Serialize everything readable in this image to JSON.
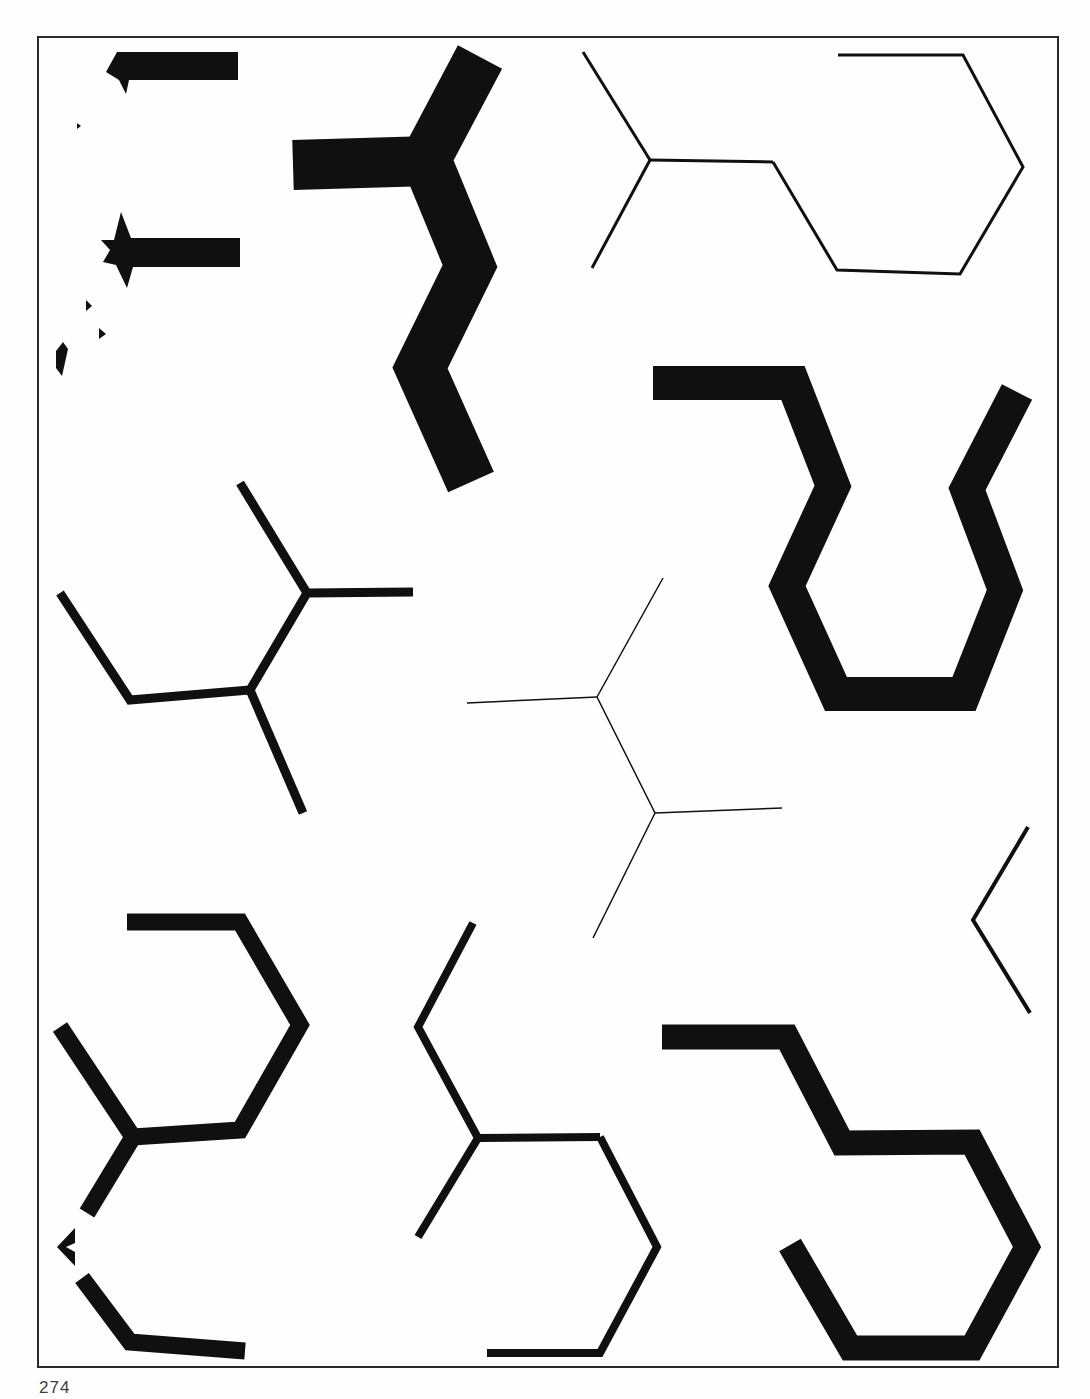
{
  "page": {
    "number": "274"
  },
  "canvas": {
    "width": 1090,
    "height": 1399,
    "paper_color": "#fefefe",
    "ink_color": "#101010",
    "frame": {
      "x": 38,
      "y": 37,
      "width": 1020,
      "height": 1330,
      "stroke": "#2a2a2a",
      "stroke_width": 2
    }
  },
  "figures": [
    {
      "name": "topleft-bar-fragment",
      "kind": "polygon",
      "points": [
        [
          117,
          52
        ],
        [
          238,
          52
        ],
        [
          238,
          80
        ],
        [
          129,
          80
        ],
        [
          126,
          94
        ],
        [
          119,
          80
        ],
        [
          106,
          72
        ]
      ]
    },
    {
      "name": "topleft-star-bar",
      "kind": "polygon",
      "points": [
        [
          121,
          212
        ],
        [
          131,
          238
        ],
        [
          240,
          238
        ],
        [
          240,
          267
        ],
        [
          133,
          267
        ],
        [
          127,
          288
        ],
        [
          116,
          265
        ],
        [
          103,
          262
        ],
        [
          110,
          250
        ],
        [
          101,
          240
        ],
        [
          114,
          240
        ]
      ]
    },
    {
      "name": "topleft-speck-1",
      "kind": "polygon",
      "points": [
        [
          77,
          123
        ],
        [
          81,
          126
        ],
        [
          77,
          129
        ]
      ]
    },
    {
      "name": "topleft-speck-2",
      "kind": "polygon",
      "points": [
        [
          86,
          300
        ],
        [
          92,
          306
        ],
        [
          86,
          311
        ]
      ]
    },
    {
      "name": "topleft-speck-3",
      "kind": "polygon",
      "points": [
        [
          99,
          328
        ],
        [
          106,
          334
        ],
        [
          99,
          339
        ]
      ]
    },
    {
      "name": "topleft-blob",
      "kind": "polygon",
      "points": [
        [
          63,
          342
        ],
        [
          68,
          349
        ],
        [
          62,
          376
        ],
        [
          56,
          368
        ],
        [
          56,
          351
        ]
      ]
    },
    {
      "name": "topmid-zigzag-spine",
      "kind": "polyline",
      "w": 50,
      "points": [
        [
          480,
          57
        ],
        [
          426,
          159
        ],
        [
          470,
          266
        ],
        [
          420,
          368
        ],
        [
          471,
          482
        ]
      ]
    },
    {
      "name": "topmid-zigzag-arm",
      "kind": "polyline",
      "w": 50,
      "points": [
        [
          293,
          165
        ],
        [
          430,
          161
        ]
      ]
    },
    {
      "name": "topright-y-upper",
      "kind": "polyline",
      "w": 3,
      "points": [
        [
          583,
          52
        ],
        [
          650,
          160
        ]
      ]
    },
    {
      "name": "topright-y-arm",
      "kind": "polyline",
      "w": 3,
      "points": [
        [
          650,
          160
        ],
        [
          773,
          162
        ]
      ]
    },
    {
      "name": "topright-y-lower",
      "kind": "polyline",
      "w": 3,
      "points": [
        [
          650,
          160
        ],
        [
          592,
          268
        ]
      ]
    },
    {
      "name": "topright-hexagon",
      "kind": "polyline",
      "w": 3,
      "points": [
        [
          773,
          162
        ],
        [
          837,
          270
        ],
        [
          960,
          274
        ],
        [
          1023,
          167
        ],
        [
          963,
          55
        ],
        [
          838,
          55
        ]
      ]
    },
    {
      "name": "midright-cup",
      "kind": "polyline",
      "w": 34,
      "points": [
        [
          653,
          383
        ],
        [
          793,
          383
        ],
        [
          833,
          486
        ],
        [
          787,
          586
        ],
        [
          836,
          694
        ],
        [
          964,
          694
        ],
        [
          1005,
          590
        ],
        [
          967,
          489
        ],
        [
          1017,
          392
        ]
      ]
    },
    {
      "name": "midleft-y-upper",
      "kind": "polyline",
      "w": 9,
      "points": [
        [
          240,
          483
        ],
        [
          307,
          593
        ]
      ]
    },
    {
      "name": "midleft-y-arm",
      "kind": "polyline",
      "w": 9,
      "points": [
        [
          307,
          593
        ],
        [
          413,
          592
        ]
      ]
    },
    {
      "name": "midleft-chain",
      "kind": "polyline",
      "w": 9,
      "points": [
        [
          307,
          593
        ],
        [
          250,
          690
        ],
        [
          130,
          700
        ],
        [
          60,
          593
        ]
      ]
    },
    {
      "name": "midleft-branch",
      "kind": "polyline",
      "w": 9,
      "points": [
        [
          250,
          690
        ],
        [
          303,
          813
        ]
      ]
    },
    {
      "name": "center-thin-upper",
      "kind": "polyline",
      "w": 1.5,
      "points": [
        [
          663,
          578
        ],
        [
          597,
          697
        ]
      ]
    },
    {
      "name": "center-thin-left-arm",
      "kind": "polyline",
      "w": 1.5,
      "points": [
        [
          597,
          697
        ],
        [
          467,
          703
        ]
      ]
    },
    {
      "name": "center-thin-mid",
      "kind": "polyline",
      "w": 1.5,
      "points": [
        [
          597,
          697
        ],
        [
          655,
          813
        ]
      ]
    },
    {
      "name": "center-thin-right-arm",
      "kind": "polyline",
      "w": 1.5,
      "points": [
        [
          655,
          813
        ],
        [
          782,
          808
        ]
      ]
    },
    {
      "name": "center-thin-lower",
      "kind": "polyline",
      "w": 1.5,
      "points": [
        [
          655,
          813
        ],
        [
          593,
          938
        ]
      ]
    },
    {
      "name": "bottomleft-hexagon",
      "kind": "polyline",
      "w": 17,
      "points": [
        [
          127,
          922
        ],
        [
          240,
          922
        ],
        [
          300,
          1025
        ],
        [
          240,
          1130
        ],
        [
          133,
          1137
        ],
        [
          60,
          1027
        ]
      ]
    },
    {
      "name": "bottomleft-branch",
      "kind": "polyline",
      "w": 17,
      "points": [
        [
          133,
          1137
        ],
        [
          87,
          1213
        ]
      ]
    },
    {
      "name": "bottomleft-chevron",
      "kind": "polygon",
      "points": [
        [
          57,
          1247
        ],
        [
          75,
          1228
        ],
        [
          75,
          1243
        ],
        [
          66,
          1247
        ],
        [
          75,
          1252
        ],
        [
          75,
          1266
        ]
      ]
    },
    {
      "name": "bottomleft-foot",
      "kind": "polyline",
      "w": 17,
      "points": [
        [
          82,
          1278
        ],
        [
          130,
          1342
        ],
        [
          245,
          1351
        ]
      ]
    },
    {
      "name": "bottommid-chain",
      "kind": "polyline",
      "w": 8,
      "points": [
        [
          473,
          923
        ],
        [
          418,
          1027
        ],
        [
          478,
          1138
        ]
      ]
    },
    {
      "name": "bottommid-arm",
      "kind": "polyline",
      "w": 8,
      "points": [
        [
          478,
          1138
        ],
        [
          600,
          1137
        ]
      ]
    },
    {
      "name": "bottommid-branch",
      "kind": "polyline",
      "w": 8,
      "points": [
        [
          478,
          1138
        ],
        [
          418,
          1237
        ]
      ]
    },
    {
      "name": "bottommid-hexagon",
      "kind": "polyline",
      "w": 8,
      "points": [
        [
          600,
          1137
        ],
        [
          657,
          1247
        ],
        [
          600,
          1353
        ],
        [
          487,
          1353
        ]
      ]
    },
    {
      "name": "bottomright-hook",
      "kind": "polyline",
      "w": 25,
      "points": [
        [
          662,
          1037
        ],
        [
          787,
          1037
        ],
        [
          842,
          1143
        ],
        [
          972,
          1142
        ],
        [
          1027,
          1247
        ],
        [
          972,
          1348
        ],
        [
          850,
          1348
        ],
        [
          790,
          1245
        ]
      ]
    },
    {
      "name": "right-chevron",
      "kind": "polyline",
      "w": 4,
      "points": [
        [
          1028,
          827
        ],
        [
          973,
          920
        ],
        [
          1030,
          1013
        ]
      ]
    }
  ]
}
